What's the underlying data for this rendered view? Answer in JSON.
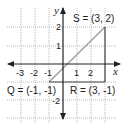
{
  "diagram": {
    "type": "coordinate-plane",
    "axes": {
      "x_label": "x",
      "y_label": "y",
      "x_ticks": [
        {
          "value": -3,
          "label": "-3"
        },
        {
          "value": -2,
          "label": "-2"
        },
        {
          "value": -1,
          "label": "-1"
        },
        {
          "value": 1,
          "label": "1"
        },
        {
          "value": 2,
          "label": "2"
        }
      ],
      "y_ticks": [
        {
          "value": 2,
          "label": "2"
        },
        {
          "value": 1,
          "label": "1"
        },
        {
          "value": -2,
          "label": "-2"
        }
      ]
    },
    "points": {
      "S": {
        "name": "S",
        "x": 3,
        "y": 2,
        "label": "S = (3, 2)"
      },
      "Q": {
        "name": "Q",
        "x": -1,
        "y": -1,
        "label": "Q = (-1, -1)"
      },
      "R": {
        "name": "R",
        "x": 3,
        "y": -1,
        "label": "R = (3, -1)"
      }
    },
    "segments": [
      {
        "from": "Q",
        "to": "R",
        "style": "dark"
      },
      {
        "from": "R",
        "to": "S",
        "style": "dark"
      },
      {
        "from": "Q",
        "to": "S",
        "style": "light"
      }
    ],
    "colors": {
      "grid": "#a8a8a8",
      "axis": "#222222",
      "edge": "#444444",
      "diagonal": "#9a9a9a"
    }
  }
}
